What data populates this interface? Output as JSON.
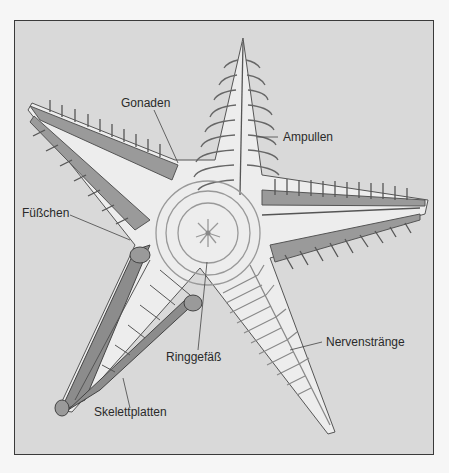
{
  "figure": {
    "labels": {
      "gonaden": "Gonaden",
      "ampullen": "Ampullen",
      "fuesschen": "Füßchen",
      "ringgefaess": "Ringgefäß",
      "nervenstraenge": "Nervenstränge",
      "skelettplatten": "Skelettplatten"
    },
    "colors": {
      "background": "#d9d9d9",
      "body": "#ececec",
      "tissue": "#9a9a9a",
      "plates": "#8c8c8c",
      "lines": "#555555"
    }
  }
}
